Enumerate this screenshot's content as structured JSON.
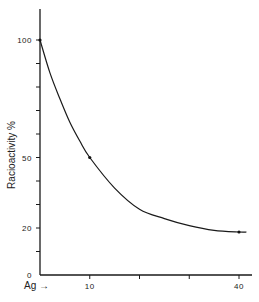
{
  "chart_data": {
    "type": "line",
    "title": "",
    "xlabel": "Ag →",
    "ylabel": "Racioactivity %",
    "xlim": [
      0,
      42
    ],
    "ylim": [
      0,
      115
    ],
    "x_ticks": [
      0,
      10,
      20,
      30,
      40
    ],
    "x_tick_labels": [
      "",
      "10",
      "",
      "",
      "40"
    ],
    "y_ticks": [
      0,
      10,
      20,
      30,
      40,
      50,
      60,
      70,
      80,
      90,
      100
    ],
    "y_tick_labels": [
      "0",
      "",
      "20",
      "",
      "",
      "50",
      "",
      "",
      "",
      "",
      "100"
    ],
    "grid": false,
    "series": [
      {
        "name": "radioactivity",
        "x": [
          0,
          2,
          4,
          6,
          8,
          10,
          15,
          20,
          25,
          30,
          35,
          40,
          41.5
        ],
        "y": [
          100,
          86,
          75,
          65,
          57,
          50,
          37,
          28,
          24,
          21,
          19,
          18.3,
          18.3
        ]
      }
    ],
    "markers": [
      {
        "x": 0,
        "y": 100
      },
      {
        "x": 10,
        "y": 50
      },
      {
        "x": 40,
        "y": 18.3
      }
    ]
  }
}
